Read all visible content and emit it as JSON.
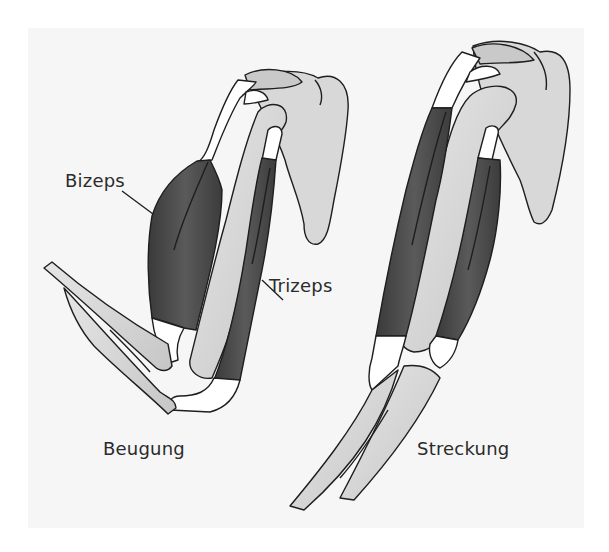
{
  "figure": {
    "title": "",
    "panels": [
      {
        "id": "flexion",
        "caption": "Beugung"
      },
      {
        "id": "extension",
        "caption": "Streckung"
      }
    ],
    "labels": {
      "biceps": "Bizeps",
      "triceps": "Trizeps"
    },
    "colors": {
      "background": "#f6f6f6",
      "muscle": "#4a4a4a",
      "bone": "#d4d4d4",
      "tendon": "#ffffff",
      "outline": "#1e1e1e",
      "text": "#2b2b2b"
    }
  }
}
